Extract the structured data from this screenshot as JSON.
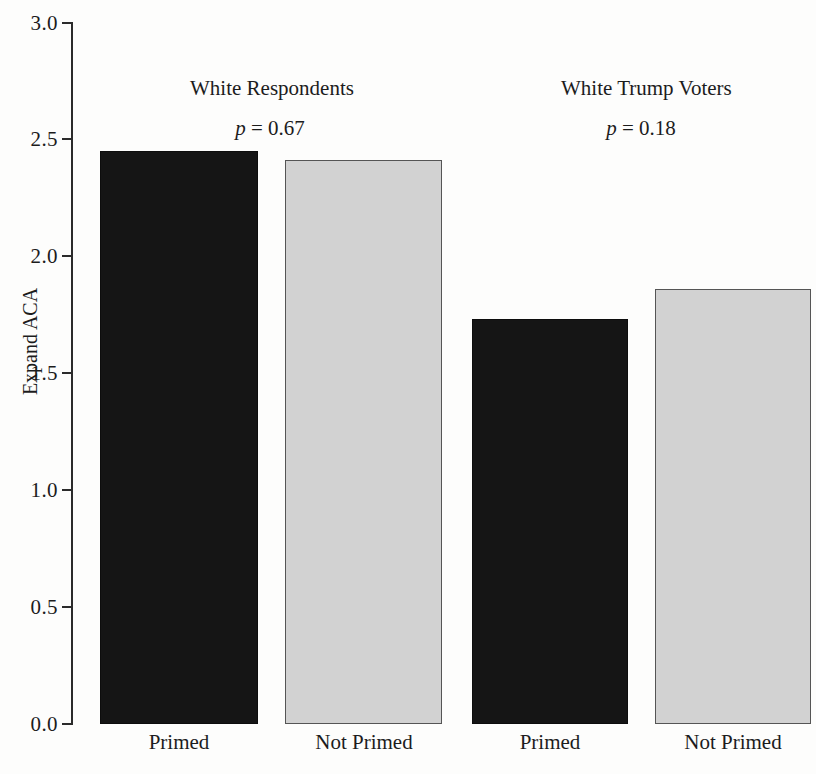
{
  "chart": {
    "type": "bar",
    "ylabel": "Expand ACA",
    "xlabel": "",
    "title": "",
    "y_ticks": [
      "0.0",
      "0.5",
      "1.0",
      "1.5",
      "2.0",
      "2.5",
      "3.0"
    ]
  },
  "groups": [
    {
      "title": "White Respondents",
      "p_symbol": "p",
      "p_text": " = 0.67",
      "p_value": 0.67
    },
    {
      "title": "White Trump Voters",
      "p_symbol": "p",
      "p_text": " = 0.18",
      "p_value": 0.18
    }
  ],
  "bars": [
    {
      "label": "Primed",
      "value": 2.45,
      "group": "White Respondents",
      "color": "#151515"
    },
    {
      "label": "Not Primed",
      "value": 2.41,
      "group": "White Respondents",
      "color": "#d2d2d2"
    },
    {
      "label": "Primed",
      "value": 1.73,
      "group": "White Trump Voters",
      "color": "#151515"
    },
    {
      "label": "Not Primed",
      "value": 1.86,
      "group": "White Trump Voters",
      "color": "#d2d2d2"
    }
  ],
  "chart_data": {
    "type": "bar",
    "title": "",
    "xlabel": "",
    "ylabel": "Expand ACA",
    "ylim": [
      0.0,
      3.0
    ],
    "yticks": [
      0.0,
      0.5,
      1.0,
      1.5,
      2.0,
      2.5,
      3.0
    ],
    "ytick_labels": [
      "0.0",
      "0.5",
      "1.0",
      "1.5",
      "2.0",
      "2.5",
      "3.0"
    ],
    "grid": false,
    "legend": "none",
    "categories": [
      "Primed",
      "Not Primed",
      "Primed",
      "Not Primed"
    ],
    "values": [
      2.45,
      2.41,
      1.73,
      1.86
    ],
    "bar_colors": [
      "#151515",
      "#d2d2d2",
      "#151515",
      "#d2d2d2"
    ],
    "groups": [
      {
        "name": "White Respondents",
        "annotation": "p = 0.67",
        "categories": [
          "Primed",
          "Not Primed"
        ],
        "values": [
          2.45,
          2.41
        ]
      },
      {
        "name": "White Trump Voters",
        "annotation": "p = 0.18",
        "categories": [
          "Primed",
          "Not Primed"
        ],
        "values": [
          1.73,
          1.86
        ]
      }
    ],
    "annotations": [
      "White Respondents",
      "p = 0.67",
      "White Trump Voters",
      "p = 0.18"
    ]
  }
}
